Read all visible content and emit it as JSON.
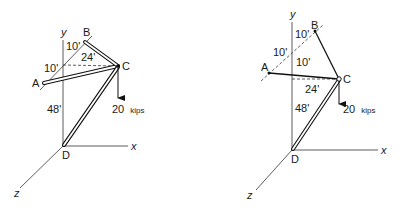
{
  "figures": [
    {
      "id": "left",
      "axes": {
        "x": "x",
        "y": "y",
        "z": "z"
      },
      "points": {
        "A": "A",
        "B": "B",
        "C": "C",
        "D": "D"
      },
      "dimensions": {
        "d1": "10'",
        "d2": "10'",
        "d3": "24'",
        "d4": "48'"
      },
      "load": {
        "value": "20",
        "unit": "kips"
      },
      "members": [
        "AC (strut)",
        "BC (strut)",
        "DC (strut)"
      ]
    },
    {
      "id": "right",
      "axes": {
        "x": "x",
        "y": "y",
        "z": "z"
      },
      "points": {
        "A": "A",
        "B": "B",
        "C": "C",
        "D": "D"
      },
      "dimensions": {
        "d1": "10'",
        "d2": "10'",
        "d3": "10'",
        "d4": "24'",
        "d5": "48'"
      },
      "load": {
        "value": "20",
        "unit": "kips"
      },
      "members": [
        "AC (cable)",
        "BC (cable)",
        "DC (strut)"
      ]
    }
  ]
}
